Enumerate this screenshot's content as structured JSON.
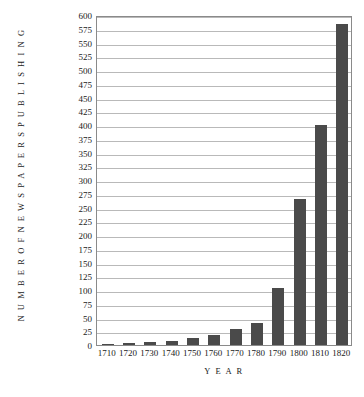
{
  "chart_data": {
    "type": "bar",
    "title": "",
    "xlabel": "Y E A R",
    "ylabel": "N U M B E R   O F   N E W S P A P E R S   P U B L I S H I N G",
    "categories": [
      "1710",
      "1720",
      "1730",
      "1740",
      "1750",
      "1760",
      "1770",
      "1780",
      "1790",
      "1800",
      "1810",
      "1820"
    ],
    "values": [
      1,
      3,
      5,
      8,
      12,
      18,
      30,
      40,
      103,
      265,
      400,
      583
    ],
    "ylim": [
      0,
      600
    ],
    "ytick_values": [
      0,
      25,
      50,
      75,
      100,
      125,
      150,
      175,
      200,
      225,
      250,
      275,
      300,
      325,
      350,
      375,
      400,
      425,
      450,
      475,
      500,
      525,
      550,
      575,
      600
    ],
    "ytick_labels": [
      "0",
      "25",
      "50",
      "75",
      "100",
      "125",
      "150",
      "175",
      "200",
      "225",
      "250",
      "275",
      "300",
      "325",
      "350",
      "375",
      "400",
      "425",
      "450",
      "475",
      "500",
      "525",
      "550",
      "575",
      "600"
    ],
    "xtick_labels": [
      "1710",
      "1720",
      "1730",
      "1740",
      "1750",
      "1760",
      "1770",
      "1780",
      "1790",
      "1800",
      "1810",
      "1820"
    ],
    "grid": true,
    "legend": false,
    "bar_color": "#4a4a4a",
    "grid_color": "#b9b9b9",
    "axis_color": "#8a8a8a",
    "background_color": "#ffffff"
  }
}
